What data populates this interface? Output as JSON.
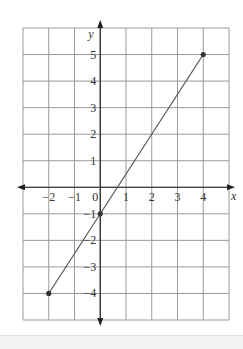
{
  "chart_data": {
    "type": "line",
    "title": "",
    "xlabel": "x",
    "ylabel": "y",
    "xlim": [
      -3,
      5
    ],
    "ylim": [
      -5,
      6
    ],
    "grid": true,
    "x_ticks": [
      -2,
      -1,
      0,
      1,
      2,
      3,
      4
    ],
    "y_ticks": [
      5,
      4,
      3,
      2,
      1,
      -1,
      -2,
      -3,
      -4
    ],
    "x_tick_labels": [
      "−2",
      "−1",
      "0",
      "1",
      "2",
      "3",
      "4"
    ],
    "y_tick_labels": [
      "5",
      "4",
      "3",
      "2",
      "1",
      "−1",
      "−2",
      "−3",
      "−4"
    ],
    "series": [
      {
        "name": "y = 1.5x - 1",
        "x": [
          -2,
          4
        ],
        "y": [
          -4,
          5
        ],
        "color": "#555555"
      }
    ],
    "points": [
      {
        "x": -2,
        "y": -4
      },
      {
        "x": 0,
        "y": -1
      },
      {
        "x": 4,
        "y": 5
      }
    ],
    "legend": null
  }
}
